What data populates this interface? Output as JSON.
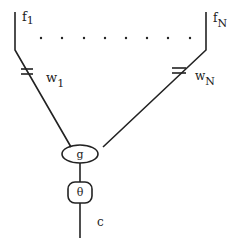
{
  "diagram": {
    "inputs": [
      {
        "label": "f",
        "subscript": "1",
        "weight_label": "w",
        "weight_subscript": "1"
      },
      {
        "label": "f",
        "subscript": "N",
        "weight_label": "w",
        "weight_subscript": "N"
      }
    ],
    "ellipsis_dots": 8,
    "aggregator": {
      "label": "g"
    },
    "threshold": {
      "label": "θ"
    },
    "output": {
      "label": "c"
    },
    "line_color": "#222222"
  }
}
